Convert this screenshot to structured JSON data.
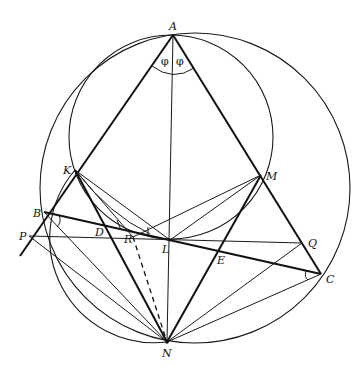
{
  "figure": {
    "type": "geometry-diagram",
    "points": {
      "A": {
        "label": "A"
      },
      "K": {
        "label": "K"
      },
      "M": {
        "label": "M"
      },
      "B": {
        "label": "B"
      },
      "P": {
        "label": "P"
      },
      "D": {
        "label": "D"
      },
      "R": {
        "label": "R"
      },
      "L": {
        "label": "L"
      },
      "E": {
        "label": "E"
      },
      "Q": {
        "label": "Q"
      },
      "C": {
        "label": "C"
      },
      "N": {
        "label": "N"
      }
    },
    "angle_labels": [
      "φ",
      "φ"
    ],
    "colors": {
      "ink": "#111111",
      "background": "#ffffff"
    }
  }
}
